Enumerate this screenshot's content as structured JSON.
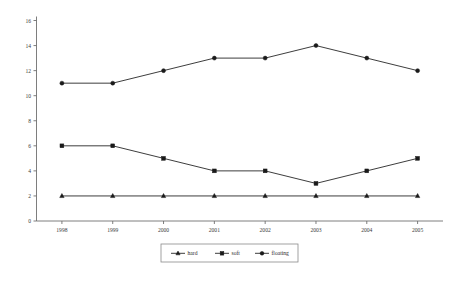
{
  "chart_data": {
    "type": "line",
    "title": "",
    "xlabel": "",
    "ylabel": "",
    "categories": [
      "1998",
      "1999",
      "2000",
      "2001",
      "2002",
      "2003",
      "2004",
      "2005"
    ],
    "ylim": [
      0,
      16
    ],
    "yticks": [
      "0",
      "2",
      "4",
      "6",
      "8",
      "10",
      "12",
      "14",
      "16"
    ],
    "ytick_values": [
      0,
      2,
      4,
      6,
      8,
      10,
      12,
      14,
      16
    ],
    "grid": false,
    "legend_position": "bottom",
    "series": [
      {
        "name": "hard",
        "marker": "triangle",
        "color": "#1a1a1a",
        "values": [
          2,
          2,
          2,
          2,
          2,
          2,
          2,
          2
        ]
      },
      {
        "name": "soft",
        "marker": "square",
        "color": "#1a1a1a",
        "values": [
          6,
          6,
          5,
          4,
          4,
          3,
          4,
          5
        ]
      },
      {
        "name": "floating",
        "marker": "circle",
        "color": "#1a1a1a",
        "values": [
          11,
          11,
          12,
          13,
          13,
          14,
          13,
          12
        ]
      }
    ]
  },
  "legend": {
    "entries": [
      {
        "label": "hard",
        "marker": "triangle"
      },
      {
        "label": "soft",
        "marker": "square"
      },
      {
        "label": "floating",
        "marker": "circle"
      }
    ]
  }
}
